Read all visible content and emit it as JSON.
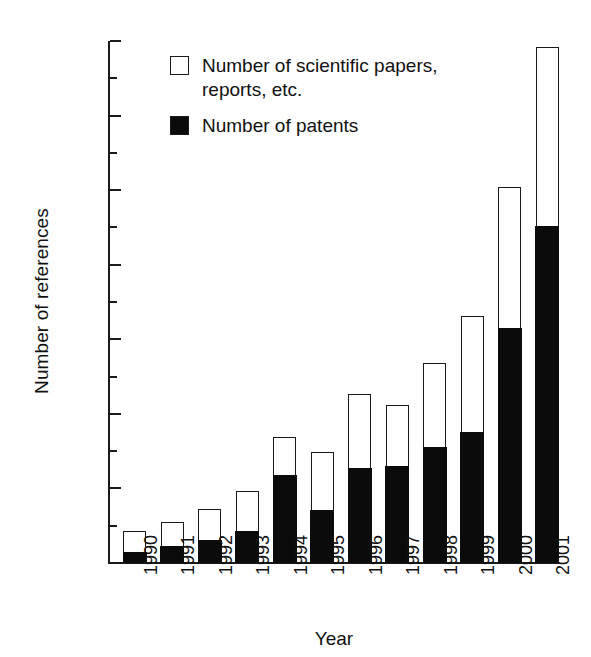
{
  "chart_data": {
    "type": "bar",
    "title": "",
    "subtitle": "",
    "xlabel": "Year",
    "ylabel": "Number of references",
    "stacked": true,
    "grid": false,
    "legend_position": "top-left-inside",
    "ylim": [
      0,
      700
    ],
    "yticks": [
      0,
      100,
      200,
      300,
      400,
      500,
      600,
      700
    ],
    "yticks_minor": [
      50,
      150,
      250,
      350,
      450,
      550,
      650
    ],
    "categories": [
      "1990",
      "1991",
      "1992",
      "1993",
      "1994",
      "1995",
      "1996",
      "1997",
      "1998",
      "1999",
      "2000",
      "2001"
    ],
    "series": [
      {
        "name": "Number of patents",
        "color": "#0b0b0b",
        "values": [
          14,
          22,
          30,
          42,
          118,
          70,
          127,
          130,
          155,
          175,
          315,
          452
        ]
      },
      {
        "name": "Number of scientific papers, reports, etc.",
        "color": "#ffffff",
        "values": [
          28,
          32,
          41,
          53,
          50,
          78,
          98,
          80,
          112,
          155,
          188,
          238
        ]
      }
    ],
    "totals": [
      42,
      54,
      71,
      95,
      168,
      148,
      225,
      210,
      267,
      330,
      503,
      690
    ]
  },
  "axes": {
    "y_title": "Number of references",
    "x_title": "Year",
    "y_tick_labels": [
      "0",
      "100",
      "200",
      "300",
      "400",
      "500",
      "600",
      "700"
    ],
    "x_tick_labels": [
      "1990",
      "1991",
      "1992",
      "1993",
      "1994",
      "1995",
      "1996",
      "1997",
      "1998",
      "1999",
      "2000",
      "2001"
    ]
  },
  "legend": {
    "items": [
      {
        "swatch": "hollow",
        "label": "Number of scientific papers,\nreports, etc."
      },
      {
        "swatch": "filled",
        "label": "Number of patents"
      }
    ],
    "item0_line1": "Number of scientific papers,",
    "item0_line2": "reports, etc.",
    "item1_line1": "Number of patents"
  },
  "colors": {
    "patents": "#0b0b0b",
    "papers": "#ffffff",
    "axis": "#1a1a1a",
    "background": "#ffffff"
  }
}
